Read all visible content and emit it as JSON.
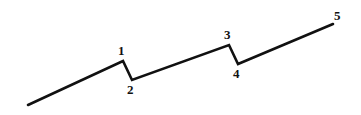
{
  "figure": {
    "background_color": "#ffffff",
    "stroke_color": "#111111",
    "stroke_width": 2.6,
    "label_color": "#111111",
    "width": 361,
    "height": 115
  },
  "chart_data": {
    "type": "line",
    "title": "",
    "xlabel": "",
    "ylabel": "",
    "xlim": [
      0,
      361
    ],
    "ylim": [
      115,
      0
    ],
    "grid": false,
    "legend": null,
    "series": [
      {
        "name": "zigzag",
        "points": [
          {
            "x": 28,
            "y": 105,
            "label": null
          },
          {
            "x": 123,
            "y": 61,
            "label": "1"
          },
          {
            "x": 132,
            "y": 80,
            "label": "2"
          },
          {
            "x": 229,
            "y": 45,
            "label": "3"
          },
          {
            "x": 238,
            "y": 64,
            "label": "4"
          },
          {
            "x": 333,
            "y": 24,
            "label": "5"
          }
        ]
      }
    ]
  },
  "labels": [
    {
      "text": "1",
      "x": 118,
      "y": 44
    },
    {
      "text": "2",
      "x": 127,
      "y": 83
    },
    {
      "text": "3",
      "x": 224,
      "y": 28
    },
    {
      "text": "4",
      "x": 233,
      "y": 67
    },
    {
      "text": "5",
      "x": 334,
      "y": 9
    }
  ]
}
